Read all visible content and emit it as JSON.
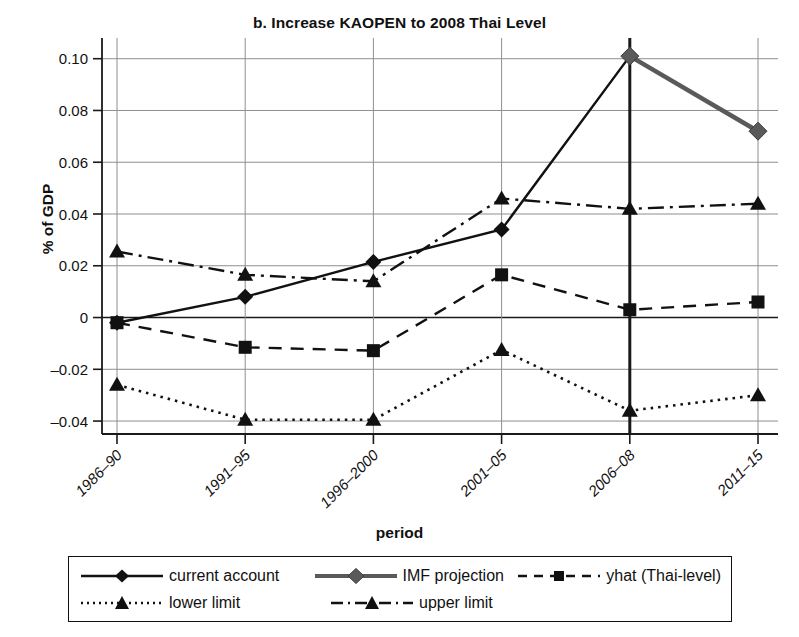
{
  "chart_data": {
    "type": "line",
    "title": "b. Increase KAOPEN to 2008 Thai Level",
    "xlabel": "period",
    "ylabel": "% of GDP",
    "categories": [
      "1986–90",
      "1991–95",
      "1996–2000",
      "2001–05",
      "2006–08",
      "2011–15"
    ],
    "ylim": [
      -0.045,
      0.108
    ],
    "yticks": [
      0.1,
      0.08,
      0.06,
      0.04,
      0.02,
      0,
      -0.02,
      -0.04
    ],
    "ytick_labels": [
      "0.10",
      "0.08",
      "0.06",
      "0.04",
      "0.02",
      "0",
      "–0.02",
      "–0.04"
    ],
    "grid": true,
    "legend_position": "below-axes",
    "series": [
      {
        "name": "current account",
        "style": "solid",
        "marker": "diamond",
        "color": "#111111",
        "values": [
          -0.002,
          0.008,
          0.0215,
          0.034,
          0.101,
          null
        ]
      },
      {
        "name": "IMF projection",
        "style": "solid-thick",
        "marker": "diamond",
        "color": "#5a5a5a",
        "values": [
          null,
          null,
          null,
          null,
          0.101,
          0.072
        ]
      },
      {
        "name": "yhat (Thai-level)",
        "style": "dashed",
        "marker": "square",
        "color": "#111111",
        "values": [
          -0.002,
          -0.0115,
          -0.0128,
          0.0165,
          0.003,
          0.006
        ]
      },
      {
        "name": "lower limit",
        "style": "dotted",
        "marker": "triangle",
        "color": "#111111",
        "values": [
          -0.026,
          -0.0395,
          -0.0395,
          -0.0125,
          -0.036,
          -0.03
        ]
      },
      {
        "name": "upper limit",
        "style": "dashdot",
        "marker": "triangle",
        "color": "#111111",
        "values": [
          0.0255,
          0.0165,
          0.014,
          0.046,
          0.042,
          0.044
        ]
      }
    ]
  },
  "legend": {
    "items": [
      {
        "label": "current account",
        "marker": "diamond-marker-icon",
        "style": "solid"
      },
      {
        "label": "IMF projection",
        "marker": "diamond-marker-icon",
        "style": "solid-thick"
      },
      {
        "label": "yhat (Thai-level)",
        "marker": "square-marker-icon",
        "style": "dashed"
      },
      {
        "label": "lower limit",
        "marker": "triangle-marker-icon",
        "style": "dotted"
      },
      {
        "label": "upper limit",
        "marker": "triangle-marker-icon",
        "style": "dashdot"
      }
    ]
  }
}
